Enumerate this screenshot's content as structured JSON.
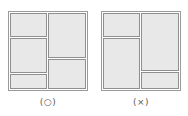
{
  "diagram": {
    "colors": {
      "cell_fill": "#e8e8e8",
      "cell_border": "#8f8f8f",
      "outer_border": "#9a9a9a",
      "caption_color": "#5a5a5a",
      "background": "#ffffff"
    },
    "figures": [
      {
        "id": "valid-partition",
        "caption": "(○)",
        "caption_meaning": "circle-mark-correct",
        "square": {
          "x": 8,
          "y": 11,
          "w": 80,
          "h": 80
        },
        "cells": [
          {
            "name": "cell-top-left",
            "x": 10,
            "y": 13,
            "w": 37,
            "h": 24
          },
          {
            "name": "cell-middle-left",
            "x": 10,
            "y": 38,
            "w": 37,
            "h": 35
          },
          {
            "name": "cell-bottom-left",
            "x": 10,
            "y": 74,
            "w": 37,
            "h": 15
          },
          {
            "name": "cell-top-right",
            "x": 48,
            "y": 13,
            "w": 38,
            "h": 45
          },
          {
            "name": "cell-bottom-right",
            "x": 48,
            "y": 59,
            "w": 38,
            "h": 30
          }
        ]
      },
      {
        "id": "invalid-partition",
        "caption": "(×)",
        "caption_meaning": "cross-mark-incorrect",
        "square": {
          "x": 101,
          "y": 11,
          "w": 80,
          "h": 80
        },
        "cells": [
          {
            "name": "cell-top-left",
            "x": 103,
            "y": 13,
            "w": 37,
            "h": 24
          },
          {
            "name": "cell-right-tall",
            "x": 141,
            "y": 13,
            "w": 38,
            "h": 58
          },
          {
            "name": "cell-lower-left-big",
            "x": 103,
            "y": 38,
            "w": 37,
            "h": 51
          },
          {
            "name": "cell-bottom-right",
            "x": 141,
            "y": 72,
            "w": 38,
            "h": 17
          }
        ]
      }
    ],
    "captions": [
      {
        "text": "(○)",
        "x": 8,
        "y": 96,
        "w": 80
      },
      {
        "text": "(×)",
        "x": 101,
        "y": 96,
        "w": 80
      }
    ]
  }
}
